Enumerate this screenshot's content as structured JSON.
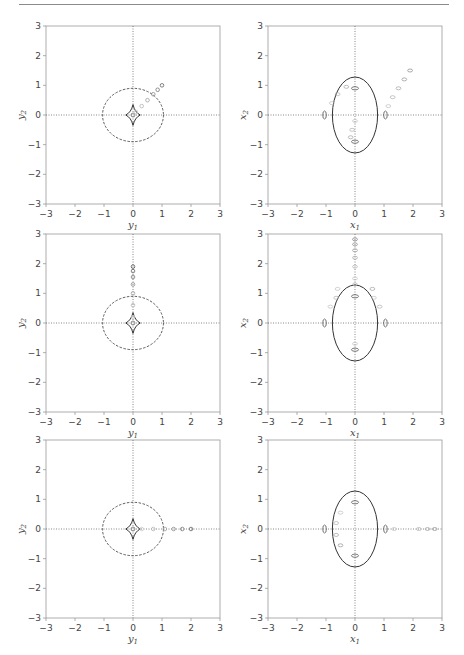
{
  "figure": {
    "rows": 3,
    "cols": 2
  },
  "axes": {
    "range": [
      -3,
      3
    ],
    "ticks": [
      "−3",
      "−2",
      "−1",
      "0",
      "1",
      "2",
      "3"
    ],
    "tick_values": [
      -3,
      -2,
      -1,
      0,
      1,
      2,
      3
    ],
    "left_xlabel_base": "y",
    "left_xlabel_sub": "1",
    "left_ylabel_base": "y",
    "left_ylabel_sub": "2",
    "right_xlabel_base": "x",
    "right_xlabel_sub": "1",
    "right_ylabel_base": "x",
    "right_ylabel_sub": "2"
  },
  "chart_data": [
    {
      "type": "scatter",
      "panel": "row1-left",
      "title": "",
      "xlabel": "y1",
      "ylabel": "y2",
      "xlim": [
        -3,
        3
      ],
      "ylim": [
        -3,
        3
      ],
      "grid": false,
      "reference_lines": [
        "dotted x=0",
        "dotted y=0"
      ],
      "curves": [
        {
          "name": "dashed circle",
          "style": "dashed",
          "center": [
            0,
            0
          ],
          "rx": 1.05,
          "ry": 0.9
        },
        {
          "name": "caustic (astroid)",
          "style": "solid",
          "center": [
            0,
            0
          ],
          "half_width": 0.25,
          "half_height": 0.35
        }
      ],
      "source_track": {
        "direction": "diagonal",
        "points": [
          [
            0.1,
            0.1
          ],
          [
            0.3,
            0.3
          ],
          [
            0.5,
            0.5
          ],
          [
            0.7,
            0.7
          ],
          [
            0.85,
            0.85
          ],
          [
            1.0,
            1.0
          ]
        ]
      }
    },
    {
      "type": "scatter",
      "panel": "row1-right",
      "xlabel": "x1",
      "ylabel": "x2",
      "xlim": [
        -3,
        3
      ],
      "ylim": [
        -3,
        3
      ],
      "grid": false,
      "curves": [
        {
          "name": "critical ellipse",
          "style": "solid",
          "center": [
            0,
            0
          ],
          "rx": 0.78,
          "ry": 1.28
        }
      ],
      "image_blobs": [
        [
          0,
          0.9
        ],
        [
          0,
          -0.9
        ],
        [
          -1.05,
          0
        ],
        [
          1.05,
          0
        ]
      ],
      "image_tracks": [
        {
          "name": "upper-right track",
          "points": [
            [
              1.15,
              0.3
            ],
            [
              1.3,
              0.6
            ],
            [
              1.5,
              0.9
            ],
            [
              1.7,
              1.2
            ],
            [
              1.9,
              1.5
            ]
          ]
        },
        {
          "name": "upper-left arc",
          "points": [
            [
              -0.8,
              0.4
            ],
            [
              -0.6,
              0.7
            ],
            [
              -0.3,
              0.95
            ]
          ]
        },
        {
          "name": "lower track",
          "points": [
            [
              0,
              -0.2
            ],
            [
              -0.1,
              -0.5
            ],
            [
              -0.15,
              -0.75
            ]
          ]
        }
      ]
    },
    {
      "type": "scatter",
      "panel": "row2-left",
      "xlabel": "y1",
      "ylabel": "y2",
      "xlim": [
        -3,
        3
      ],
      "ylim": [
        -3,
        3
      ],
      "curves": [
        {
          "name": "dashed circle",
          "style": "dashed",
          "center": [
            0,
            0
          ],
          "rx": 1.05,
          "ry": 0.9
        },
        {
          "name": "caustic (astroid)",
          "style": "solid",
          "center": [
            0,
            0
          ],
          "half_width": 0.25,
          "half_height": 0.35
        }
      ],
      "source_track": {
        "direction": "vertical",
        "points": [
          [
            0,
            0.2
          ],
          [
            0,
            0.6
          ],
          [
            0,
            1.0
          ],
          [
            0,
            1.3
          ],
          [
            0,
            1.55
          ],
          [
            0,
            1.75
          ],
          [
            0,
            1.9
          ]
        ]
      }
    },
    {
      "type": "scatter",
      "panel": "row2-right",
      "xlabel": "x1",
      "ylabel": "x2",
      "xlim": [
        -3,
        3
      ],
      "ylim": [
        -3,
        3
      ],
      "curves": [
        {
          "name": "critical ellipse",
          "style": "solid",
          "center": [
            0,
            0
          ],
          "rx": 0.78,
          "ry": 1.28
        }
      ],
      "image_blobs": [
        [
          0,
          0.9
        ],
        [
          0,
          -0.9
        ],
        [
          -1.05,
          0
        ],
        [
          1.05,
          0
        ]
      ],
      "image_tracks": [
        {
          "name": "vertical upper track",
          "points": [
            [
              0,
              1.5
            ],
            [
              0,
              1.9
            ],
            [
              0,
              2.2
            ],
            [
              0,
              2.45
            ],
            [
              0,
              2.65
            ],
            [
              0,
              2.82
            ]
          ]
        },
        {
          "name": "upper arcs",
          "points": [
            [
              -0.6,
              1.15
            ],
            [
              0,
              1.3
            ],
            [
              0.6,
              1.15
            ]
          ]
        },
        {
          "name": "left lobe",
          "points": [
            [
              -0.85,
              0.55
            ],
            [
              -0.65,
              0.85
            ]
          ]
        },
        {
          "name": "right lobe",
          "points": [
            [
              0.65,
              0.85
            ],
            [
              0.85,
              0.55
            ]
          ]
        },
        {
          "name": "lower small",
          "points": [
            [
              0,
              -0.7
            ]
          ]
        }
      ]
    },
    {
      "type": "scatter",
      "panel": "row3-left",
      "xlabel": "y1",
      "ylabel": "y2",
      "xlim": [
        -3,
        3
      ],
      "ylim": [
        -3,
        3
      ],
      "curves": [
        {
          "name": "dashed circle",
          "style": "dashed",
          "center": [
            0,
            0
          ],
          "rx": 1.05,
          "ry": 0.9
        },
        {
          "name": "caustic (astroid)",
          "style": "solid",
          "center": [
            0,
            0
          ],
          "half_width": 0.25,
          "half_height": 0.35
        }
      ],
      "source_track": {
        "direction": "horizontal",
        "points": [
          [
            0.3,
            0
          ],
          [
            0.7,
            0
          ],
          [
            1.1,
            0
          ],
          [
            1.4,
            0
          ],
          [
            1.7,
            0
          ],
          [
            2.0,
            0
          ]
        ]
      }
    },
    {
      "type": "scatter",
      "panel": "row3-right",
      "xlabel": "x1",
      "ylabel": "x2",
      "xlim": [
        -3,
        3
      ],
      "ylim": [
        -3,
        3
      ],
      "curves": [
        {
          "name": "critical ellipse",
          "style": "solid",
          "center": [
            0,
            0
          ],
          "rx": 0.78,
          "ry": 1.28
        }
      ],
      "image_blobs": [
        [
          0,
          0.9
        ],
        [
          0,
          -0.9
        ],
        [
          -1.05,
          0
        ],
        [
          1.05,
          0
        ]
      ],
      "image_tracks": [
        {
          "name": "horizontal right track",
          "points": [
            [
              1.35,
              0
            ],
            [
              2.2,
              0
            ],
            [
              2.5,
              0
            ],
            [
              2.75,
              0
            ]
          ]
        },
        {
          "name": "left inner arc",
          "points": [
            [
              -0.5,
              0.55
            ],
            [
              -0.65,
              0.2
            ],
            [
              -0.65,
              -0.2
            ],
            [
              -0.5,
              -0.55
            ]
          ]
        }
      ]
    }
  ]
}
